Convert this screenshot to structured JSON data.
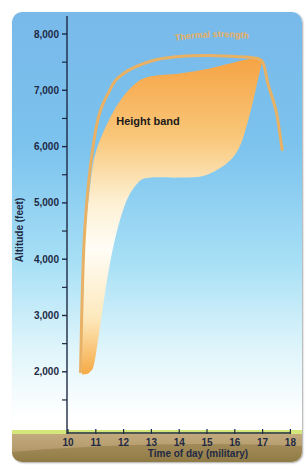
{
  "chart_data": {
    "type": "area",
    "title": "",
    "xlabel": "Time of day (military)",
    "ylabel": "Altitude (feet)",
    "x_ticks": [
      10,
      11,
      12,
      13,
      14,
      15,
      16,
      17,
      18
    ],
    "x_tick_labels": [
      "10",
      "11",
      "12",
      "13",
      "14",
      "15",
      "16",
      "17",
      "18"
    ],
    "y_ticks": [
      2000,
      3000,
      4000,
      5000,
      6000,
      7000,
      8000
    ],
    "y_tick_labels": [
      "2,000",
      "3,000",
      "4,000",
      "5,000",
      "6,000",
      "7,000",
      "8,000"
    ],
    "xlim": [
      10,
      18
    ],
    "ylim": [
      1000,
      8300
    ],
    "grid": false,
    "annotations": [
      "Height band",
      "Thermal strength"
    ],
    "series": [
      {
        "name": "Height band (top)",
        "type": "area-upper",
        "x": [
          10.5,
          10.6,
          10.8,
          11.0,
          11.5,
          12.0,
          12.5,
          13.0,
          14.0,
          15.0,
          16.0,
          16.5,
          17.0
        ],
        "y": [
          1950,
          4200,
          5300,
          5900,
          6500,
          6900,
          7150,
          7250,
          7300,
          7380,
          7500,
          7550,
          7550
        ]
      },
      {
        "name": "Height band (bottom)",
        "type": "area-lower",
        "x": [
          10.5,
          10.8,
          11.0,
          11.5,
          12.0,
          12.5,
          13.0,
          14.0,
          15.0,
          16.0,
          16.5,
          17.0
        ],
        "y": [
          1950,
          2000,
          2300,
          3900,
          4900,
          5350,
          5450,
          5450,
          5500,
          5850,
          6500,
          7550
        ]
      },
      {
        "name": "Thermal strength",
        "type": "line",
        "x": [
          10.45,
          10.6,
          11.0,
          11.5,
          12.0,
          13.0,
          14.0,
          15.0,
          16.0,
          16.6,
          17.0,
          17.2,
          17.5,
          17.7
        ],
        "y": [
          2000,
          4500,
          6300,
          7000,
          7300,
          7520,
          7600,
          7620,
          7600,
          7580,
          7500,
          7100,
          6600,
          5950
        ]
      }
    ]
  },
  "labels": {
    "band": "Height band",
    "thermal": "Thermal strength",
    "xlabel": "Time of day (military)",
    "ylabel": "Altitude (feet)"
  },
  "colors": {
    "sky_top": "#78b9ea",
    "sky_bottom": "#ffffff",
    "band_top": "#f6a94a",
    "band_bottom": "#fffbf0",
    "thermal_line": "#e9b164",
    "ground": "#b59c6e",
    "ground_top": "#d4e77a",
    "axis": "#1f2a44"
  }
}
